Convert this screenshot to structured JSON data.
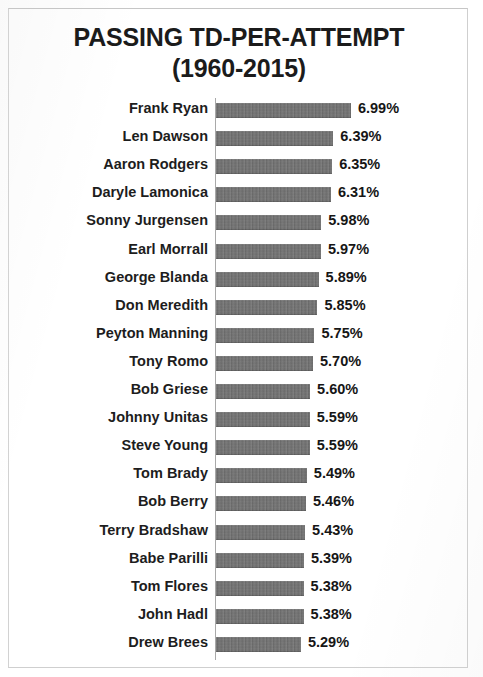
{
  "chart_title": {
    "line1": "PASSING TD-PER-ATTEMPT",
    "line2": "(1960-2015)"
  },
  "colors": {
    "bar": "#6f6f6f",
    "text": "#1d1d1d",
    "axis": "#a9a9a9",
    "background": "#ffffff",
    "frame": "#cfcfcf"
  },
  "chart_data": {
    "type": "bar",
    "orientation": "horizontal",
    "title": "PASSING TD-PER-ATTEMPT (1960-2015)",
    "xlabel": "",
    "ylabel": "",
    "grid": false,
    "legend": null,
    "axis_origin_value": 2.4,
    "xlim": [
      2.4,
      7.1
    ],
    "value_suffix": "%",
    "categories": [
      "Frank Ryan",
      "Len Dawson",
      "Aaron Rodgers",
      "Daryle Lamonica",
      "Sonny Jurgensen",
      "Earl Morrall",
      "George Blanda",
      "Don Meredith",
      "Peyton Manning",
      "Tony Romo",
      "Bob Griese",
      "Johnny Unitas",
      "Steve Young",
      "Tom Brady",
      "Bob Berry",
      "Terry Bradshaw",
      "Babe Parilli",
      "Tom Flores",
      "John Hadl",
      "Drew Brees"
    ],
    "values": [
      6.99,
      6.39,
      6.35,
      6.31,
      5.98,
      5.97,
      5.89,
      5.85,
      5.75,
      5.7,
      5.6,
      5.59,
      5.59,
      5.49,
      5.46,
      5.43,
      5.39,
      5.38,
      5.38,
      5.29
    ],
    "value_labels": [
      "6.99%",
      "6.39%",
      "6.35%",
      "6.31%",
      "5.98%",
      "5.97%",
      "5.89%",
      "5.85%",
      "5.75%",
      "5.70%",
      "5.60%",
      "5.59%",
      "5.59%",
      "5.49%",
      "5.46%",
      "5.43%",
      "5.39%",
      "5.38%",
      "5.38%",
      "5.29%"
    ]
  }
}
